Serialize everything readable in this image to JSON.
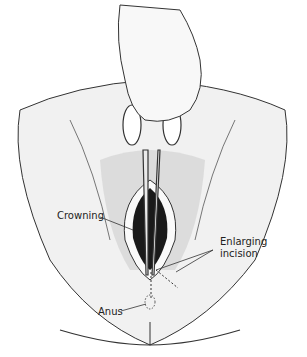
{
  "figure": {
    "labels": {
      "crowning": "Crowning",
      "enlarging_line1": "Enlarging",
      "enlarging_line2": "incision",
      "anus": "Anus"
    },
    "colors": {
      "skin": "#f1f1f1",
      "outline": "#333333",
      "dark": "#1a1a1a"
    }
  }
}
